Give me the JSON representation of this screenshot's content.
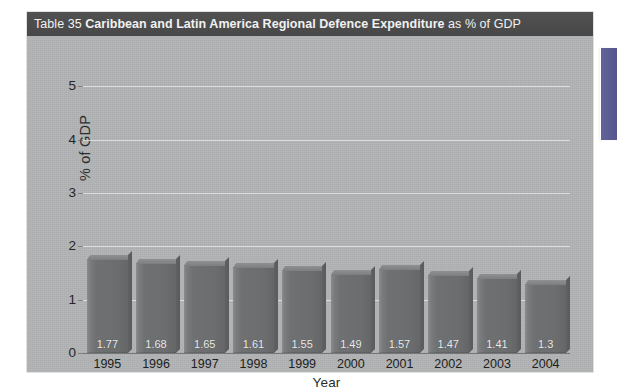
{
  "figure": {
    "caption_prefix": "Table 35 ",
    "caption_strong": "Caribbean and Latin America Regional Defence Expenditure",
    "caption_suffix": " as % of GDP"
  },
  "chart_data": {
    "type": "bar",
    "title": "Caribbean and Latin America Regional Defence Expenditure as % of GDP",
    "xlabel": "Year",
    "ylabel": "% of GDP",
    "categories": [
      "1995",
      "1996",
      "1997",
      "1998",
      "1999",
      "2000",
      "2001",
      "2002",
      "2003",
      "2004"
    ],
    "values": [
      1.77,
      1.68,
      1.65,
      1.61,
      1.55,
      1.49,
      1.57,
      1.47,
      1.41,
      1.3
    ],
    "value_labels": [
      "1.77",
      "1.68",
      "1.65",
      "1.61",
      "1.55",
      "1.49",
      "1.57",
      "1.47",
      "1.41",
      "1.3"
    ],
    "ylim": [
      0,
      5.4
    ],
    "yticks": [
      0,
      1,
      2,
      3,
      4,
      5
    ],
    "ytick_labels": [
      "0",
      "1",
      "2",
      "3",
      "4",
      "5"
    ],
    "grid": true,
    "legend": null,
    "series_name": "Defence expenditure (% of GDP)"
  },
  "colors": {
    "panel_background": "#b1b3b4",
    "caption_bar": "#4c4c4c",
    "caption_text": "#f1f1f1",
    "bar_fill": "#6e7072",
    "bar_value_text": "#e9eaea",
    "gridline": "#e4e6e7",
    "axis_text": "#262626",
    "side_marker": "#5b5a92",
    "page_background": "#ffffff"
  },
  "side_marker": {
    "name": "page-edge-tab"
  }
}
